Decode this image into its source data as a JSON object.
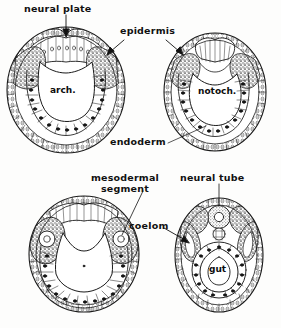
{
  "figure": {
    "background_color": "#fdfdfc",
    "ink_color": "#1a1a1a",
    "shade_color": "#6e6e6e"
  },
  "labels": {
    "neural_plate": "neural plate",
    "epidermis": "epidermis",
    "endoderm": "endoderm",
    "mesodermal_segment_line1": "mesodermal",
    "mesodermal_segment_line2": "segment",
    "neural_tube": "neural tube",
    "coelom": "coelom"
  },
  "inner_labels": {
    "arch": "arch.",
    "notoch": "notoch.",
    "gut": "gut"
  },
  "panels": [
    {
      "id": "top-left",
      "stage": "neural plate stage",
      "inner_label": "arch.",
      "position": {
        "cx": 66,
        "cy": 90,
        "rx": 59,
        "ry": 63
      }
    },
    {
      "id": "top-right",
      "stage": "neural fold stage",
      "inner_label": "notoch.",
      "position": {
        "cx": 215,
        "cy": 92,
        "rx": 51,
        "ry": 59
      }
    },
    {
      "id": "bottom-left",
      "stage": "mesodermal segment stage",
      "inner_label": "",
      "position": {
        "cx": 84,
        "cy": 254,
        "rx": 55,
        "ry": 58
      }
    },
    {
      "id": "bottom-right",
      "stage": "neural tube / gut stage",
      "inner_label": "gut",
      "position": {
        "cx": 219,
        "cy": 255,
        "rx": 44,
        "ry": 57
      }
    }
  ],
  "annotations": [
    {
      "name": "neural-plate-arrow",
      "from": "neural plate",
      "to": "top-left-panel"
    },
    {
      "name": "epidermis-arrow-left",
      "from": "epidermis",
      "to": "top-left-panel"
    },
    {
      "name": "epidermis-arrow-right",
      "from": "epidermis",
      "to": "top-right-panel"
    },
    {
      "name": "endoderm-leader-right",
      "from": "endoderm",
      "to": "top-right-panel"
    },
    {
      "name": "mesodermal-segment-leader",
      "from": "mesodermal segment",
      "to": "bottom-left-panel"
    },
    {
      "name": "neural-tube-leader",
      "from": "neural tube",
      "to": "bottom-right-panel"
    },
    {
      "name": "coelom-arrow",
      "from": "coelom",
      "to": "bottom-right-panel"
    }
  ]
}
